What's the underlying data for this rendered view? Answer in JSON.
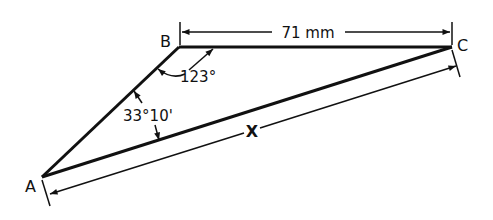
{
  "diagram": {
    "type": "triangle-dimension-drawing",
    "vertices": {
      "A": "A",
      "B": "B",
      "C": "C"
    },
    "labels": {
      "bc_length": "71 mm",
      "angle_b": "123°",
      "angle_a": "33°10'",
      "ac_unknown": "X"
    },
    "colors": {
      "stroke": "#111111",
      "background": "#ffffff"
    }
  }
}
